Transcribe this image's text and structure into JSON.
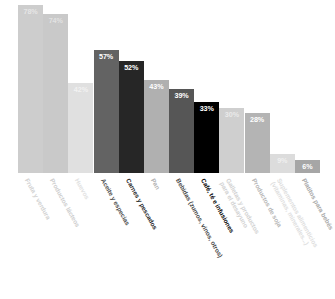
{
  "chart_data": {
    "type": "bar",
    "title": "",
    "subtitle": "",
    "xlabel": "",
    "ylabel": "",
    "ylim": [
      0,
      100
    ],
    "grid": false,
    "legend": "none",
    "value_suffix": "%",
    "categories": [
      "Fruta y verdura",
      "Productos lácteos",
      "Huevos",
      "Aceite y especias",
      "Carnes y pescados",
      "Pan",
      "Bebidas (zumos, vinos, otros)",
      "Café, té e infusiones",
      "Galletas y productos\npara el desayuno",
      "Productos de soja",
      "Suplementos alimenticios\n(vitaminas, minerales...)",
      "Platitos para bebés"
    ],
    "values": [
      78,
      74,
      42,
      57,
      52,
      43,
      39,
      33,
      30,
      28,
      9,
      6
    ],
    "value_labels": [
      "78%",
      "74%",
      "42%",
      "57%",
      "52%",
      "43%",
      "39%",
      "33%",
      "30%",
      "28%",
      "9%",
      "6%"
    ],
    "bar_colors": [
      "#cdcdcd",
      "#c9c9c9",
      "#e0e0e0",
      "#636363",
      "#262626",
      "#b0b0b0",
      "#565656",
      "#000000",
      "#cfcfcf",
      "#b4b4b4",
      "#dcdcdc",
      "#a6a6a6"
    ],
    "value_label_colors": [
      "#e6e6e6",
      "#e2e2e2",
      "#f2f2f2",
      "#ffffff",
      "#ffffff",
      "#ffffff",
      "#ffffff",
      "#ffffff",
      "#eaeaea",
      "#ffffff",
      "#f0f0f0",
      "#ffffff"
    ],
    "category_label_colors": [
      "#d2d2d2",
      "#cecece",
      "#e2e2e2",
      "#4f4f4f",
      "#1f1f1f",
      "#b2b2b2",
      "#4a4a4a",
      "#000000",
      "#d2d2d2",
      "#b6b6b6",
      "#dedede",
      "#a8a8a8"
    ]
  }
}
